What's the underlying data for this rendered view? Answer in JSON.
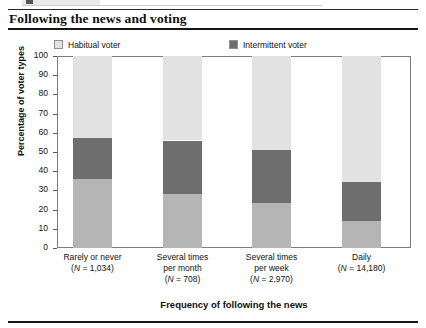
{
  "figure": {
    "title": "Following the news and voting"
  },
  "legend": [
    {
      "label": "Habitual voter",
      "color": "#e2e2e2",
      "key": "habitual_voter"
    },
    {
      "label": "Intermittent voter",
      "color": "#6e6e6e",
      "key": "intermittent_voter"
    },
    {
      "label": "Habitual non-voter",
      "color": "#b5b5b5",
      "key": "habitual_non_voter"
    }
  ],
  "axes": {
    "y_title": "Percentage of voter types",
    "x_title": "Frequency of following the news",
    "y_ticks": [
      "100",
      "90",
      "80",
      "70",
      "60",
      "50",
      "40",
      "30",
      "20",
      "10",
      "0"
    ]
  },
  "x_labels": [
    {
      "line1": "Rarely or never",
      "line2": "(N = 1,034)",
      "line3": ""
    },
    {
      "line1": "Several times",
      "line2": "per month",
      "line3": "(N = 708)"
    },
    {
      "line1": "Several times",
      "line2": "per week",
      "line3": "(N = 2,970)"
    },
    {
      "line1": "Daily",
      "line2": "(N = 14,180)",
      "line3": ""
    }
  ],
  "chart_data": {
    "type": "bar",
    "stacked": true,
    "title": "Following the news and voting",
    "xlabel": "Frequency of following the news",
    "ylabel": "Percentage of voter types",
    "ylim": [
      0,
      100
    ],
    "ytick_step": 10,
    "grid": false,
    "legend_position": "top",
    "categories": [
      "Rarely or never (N = 1,034)",
      "Several times per month (N = 708)",
      "Several times per week (N = 2,970)",
      "Daily (N = 14,180)"
    ],
    "sample_sizes": [
      1034,
      708,
      2970,
      14180
    ],
    "series": [
      {
        "name": "Habitual non-voter",
        "color": "#b5b5b5",
        "values": [
          36.0,
          28.0,
          23.5,
          14.0
        ]
      },
      {
        "name": "Intermittent voter",
        "color": "#6e6e6e",
        "values": [
          21.5,
          28.0,
          27.5,
          20.5
        ]
      },
      {
        "name": "Habitual voter",
        "color": "#e2e2e2",
        "values": [
          42.5,
          44.0,
          49.0,
          65.5
        ]
      }
    ],
    "stack_boundaries": [
      {
        "category": "Rarely or never",
        "non_voter_top": 36.0,
        "intermittent_top": 57.5
      },
      {
        "category": "Several times per month",
        "non_voter_top": 28.0,
        "intermittent_top": 56.0
      },
      {
        "category": "Several times per week",
        "non_voter_top": 23.5,
        "intermittent_top": 51.0
      },
      {
        "category": "Daily",
        "non_voter_top": 14.0,
        "intermittent_top": 34.5
      }
    ]
  }
}
